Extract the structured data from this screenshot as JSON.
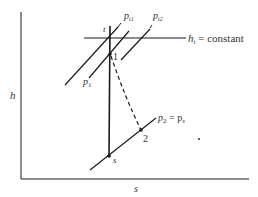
{
  "diagram": {
    "axes": {
      "y_label": "h",
      "x_label": "s"
    },
    "lines": {
      "ht_constant": {
        "label_main": "h",
        "label_sub": "t",
        "label_rest": " = constant"
      },
      "p1": {
        "label_main": "p",
        "label_sub": "1"
      },
      "pt1": {
        "label_main": "p",
        "label_sub": "t1"
      },
      "pt2": {
        "label_main": "p",
        "label_sub": "t2"
      },
      "p2": {
        "label_main": "p",
        "label_sub": "2",
        "label_eq": " = p",
        "label_eq_sub": "s"
      }
    },
    "points": {
      "t": "t",
      "one": "1",
      "two": "2",
      "s": "s"
    },
    "colors": {
      "line": "#1a1a1a",
      "text": "#333333",
      "background": "#ffffff"
    }
  }
}
